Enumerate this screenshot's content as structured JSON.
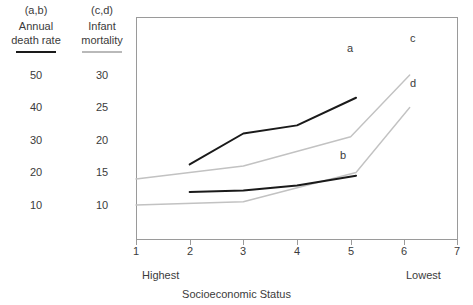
{
  "chart_data": {
    "type": "line",
    "title": "",
    "xlabel": "Socioeconomic Status",
    "xlim": [
      1,
      7
    ],
    "xticks": [
      1,
      2,
      3,
      4,
      5,
      6,
      7
    ],
    "x_end_labels": {
      "left": "Highest",
      "right": "Lowest"
    },
    "grid": false,
    "legend": "inline-end-labels",
    "axes": [
      {
        "id": "left",
        "key": "(a,b)",
        "title_line1": "Annual",
        "title_line2": "death rate",
        "ticks": [
          50,
          40,
          30,
          20,
          10
        ],
        "ylim": [
          0,
          50
        ],
        "rule_color": "#1a1a1a"
      },
      {
        "id": "right",
        "key": "(c,d)",
        "title_line1": "Infant",
        "title_line2": "mortality",
        "ticks": [
          30,
          25,
          20,
          15,
          10
        ],
        "ylim": [
          5,
          30
        ],
        "rule_color": "#b9b9b9"
      }
    ],
    "series": [
      {
        "name": "a",
        "axis": "left",
        "color": "#1a1a1a",
        "x": [
          2,
          3,
          4,
          5.1
        ],
        "values": [
          22.5,
          32,
          34.5,
          43
        ]
      },
      {
        "name": "b",
        "axis": "left",
        "color": "#1a1a1a",
        "x": [
          2,
          3,
          4,
          5.1
        ],
        "values": [
          14,
          14.5,
          16,
          19
        ]
      },
      {
        "name": "c",
        "axis": "right",
        "color": "#c2c2c2",
        "x": [
          1,
          3,
          5,
          6.1
        ],
        "values": [
          14,
          16,
          20.5,
          30
        ]
      },
      {
        "name": "d",
        "axis": "right",
        "color": "#c2c2c2",
        "x": [
          1,
          3,
          5.1,
          6.1
        ],
        "values": [
          10,
          10.5,
          15,
          25
        ]
      }
    ]
  }
}
